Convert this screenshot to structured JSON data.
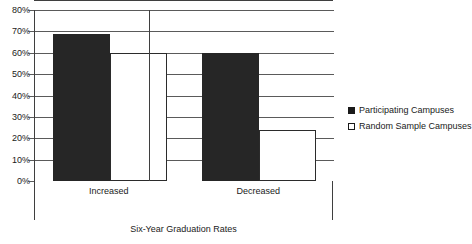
{
  "chart_data": {
    "type": "bar",
    "title": "",
    "xlabel": "Six-Year Graduation Rates",
    "ylabel": "",
    "categories": [
      "Increased",
      "Decreased"
    ],
    "series": [
      {
        "name": "Participating Campuses",
        "values": [
          69,
          60
        ],
        "style": "filled",
        "color": "#262626"
      },
      {
        "name": "Random Sample Campuses",
        "values": [
          60,
          24
        ],
        "style": "hollow",
        "color": "#ffffff"
      }
    ],
    "ylim": [
      0,
      80
    ],
    "y_ticks": [
      0,
      10,
      20,
      30,
      40,
      50,
      60,
      70,
      80
    ],
    "y_tick_labels": [
      "0%",
      "10%",
      "20%",
      "30%",
      "40%",
      "50%",
      "60%",
      "70%",
      "80%"
    ],
    "grid": true,
    "legend_position": "right",
    "value_suffix": "%"
  },
  "legend": {
    "entries": [
      {
        "label": "Participating Campuses",
        "marker": "filled-square"
      },
      {
        "label": "Random Sample Campuses",
        "marker": "hollow-square"
      }
    ]
  },
  "axis": {
    "x_title": "Six-Year Graduation Rates",
    "category_labels": [
      "Increased",
      "Decreased"
    ]
  }
}
